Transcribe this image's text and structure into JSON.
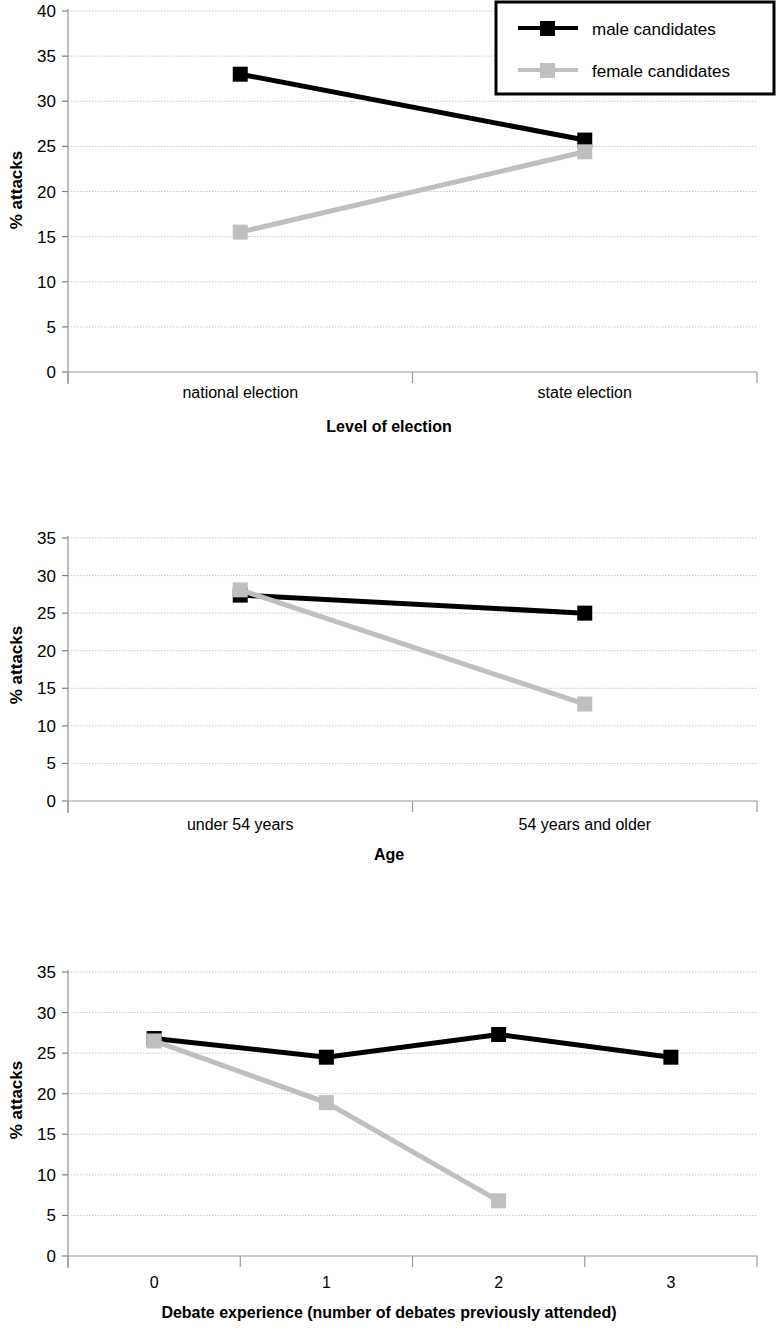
{
  "figure": {
    "series_colors": {
      "male": "#000000",
      "female": "#bfbfbf"
    },
    "legend": {
      "male_label": "male candidates",
      "female_label": "female candidates"
    }
  },
  "chart_data": [
    {
      "type": "line",
      "title": "",
      "xlabel": "Level of election",
      "ylabel": "% attacks",
      "categories": [
        "national election",
        "state election"
      ],
      "ylim": [
        0,
        40
      ],
      "yticks": [
        0,
        5,
        10,
        15,
        20,
        25,
        30,
        35,
        40
      ],
      "ytick_labels": [
        "0",
        "5",
        "10",
        "15",
        "20",
        "25",
        "30",
        "35",
        "40"
      ],
      "grid": true,
      "legend_position": "top-right",
      "series": [
        {
          "name": "male candidates",
          "values": [
            33.0,
            25.7
          ]
        },
        {
          "name": "female candidates",
          "values": [
            15.5,
            24.4
          ]
        }
      ]
    },
    {
      "type": "line",
      "title": "",
      "xlabel": "Age",
      "ylabel": "% attacks",
      "categories": [
        "under 54 years",
        "54 years and older"
      ],
      "ylim": [
        0,
        35
      ],
      "yticks": [
        0,
        5,
        10,
        15,
        20,
        25,
        30,
        35
      ],
      "ytick_labels": [
        "0",
        "5",
        "10",
        "15",
        "20",
        "25",
        "30",
        "35"
      ],
      "grid": true,
      "legend_position": "none",
      "series": [
        {
          "name": "male candidates",
          "values": [
            27.4,
            25.0
          ]
        },
        {
          "name": "female candidates",
          "values": [
            28.1,
            12.9
          ]
        }
      ]
    },
    {
      "type": "line",
      "title": "",
      "xlabel": "Debate experience (number of debates previously attended)",
      "ylabel": "% attacks",
      "categories": [
        "0",
        "1",
        "2",
        "3"
      ],
      "ylim": [
        0,
        35
      ],
      "yticks": [
        0,
        5,
        10,
        15,
        20,
        25,
        30,
        35
      ],
      "ytick_labels": [
        "0",
        "5",
        "10",
        "15",
        "20",
        "25",
        "30",
        "35"
      ],
      "grid": true,
      "legend_position": "none",
      "series": [
        {
          "name": "male candidates",
          "values": [
            26.8,
            24.5,
            27.3,
            24.5
          ]
        },
        {
          "name": "female candidates",
          "values": [
            26.5,
            18.9,
            6.8,
            null
          ]
        }
      ]
    }
  ]
}
